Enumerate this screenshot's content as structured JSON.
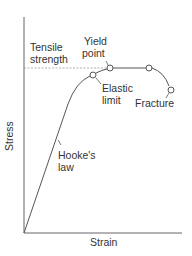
{
  "diagram": {
    "title": "",
    "type": "stress-strain curve",
    "axes": {
      "x_label": "Strain",
      "y_label": "Stress"
    },
    "labels": {
      "tensile_strength_line1": "Tensile",
      "tensile_strength_line2": "strength",
      "yield_point_line1": "Yield",
      "yield_point_line2": "point",
      "elastic_limit_line1": "Elastic",
      "elastic_limit_line2": "limit",
      "fracture": "Fracture",
      "hookes_law_line1": "Hooke's",
      "hookes_law_line2": "law"
    },
    "points": [
      {
        "name": "Elastic limit",
        "x": 93,
        "y": 75
      },
      {
        "name": "Yield point",
        "x": 110,
        "y": 68
      },
      {
        "name": "Tensile strength",
        "x": 149,
        "y": 68
      },
      {
        "name": "Fracture",
        "x": 171,
        "y": 90
      }
    ],
    "colors": {
      "line": "#555555",
      "dashed": "#888888",
      "text": "#333333",
      "background": "#ffffff"
    }
  }
}
